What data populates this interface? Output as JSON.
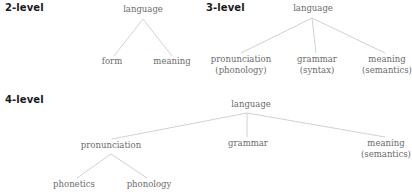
{
  "diagrams": [
    {
      "heading": "2-level",
      "root": "language",
      "children": [
        {
          "label": "form",
          "sub": ""
        },
        {
          "label": "meaning",
          "sub": ""
        }
      ]
    },
    {
      "heading": "3-level",
      "root": "language",
      "children": [
        {
          "label": "pronunciation",
          "sub": "(phonology)"
        },
        {
          "label": "grammar",
          "sub": "(syntax)"
        },
        {
          "label": "meaning",
          "sub": "(semantics)"
        }
      ]
    },
    {
      "heading": "4-level",
      "root": "language",
      "children": [
        {
          "label": "pronunciation",
          "sub": "",
          "children": [
            {
              "label": "phonetics"
            },
            {
              "label": "phonology"
            }
          ]
        },
        {
          "label": "grammar",
          "sub": ""
        },
        {
          "label": "meaning",
          "sub": "(semantics)"
        }
      ]
    }
  ],
  "colors": {
    "heading": "#1a1a1a",
    "node_text": "#6b6b6b",
    "edge": "#d2d2d2"
  }
}
